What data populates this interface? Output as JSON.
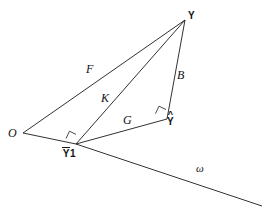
{
  "figure": {
    "type": "geometry-diagram",
    "stroke_color": "#1a1a1a",
    "background_color": "#ffffff",
    "vertices": [
      {
        "id": "O",
        "label": "O",
        "style": "italic-serif",
        "x": 23,
        "y": 133
      },
      {
        "id": "Ybar1",
        "label": "Y",
        "accent": "bar",
        "subscript": "1",
        "style": "bold-sans",
        "x": 76,
        "y": 144
      },
      {
        "id": "Yhat",
        "label": "Y",
        "accent": "hat",
        "style": "bold-sans",
        "x": 167,
        "y": 119
      },
      {
        "id": "Y",
        "label": "Y",
        "style": "bold-sans",
        "x": 185,
        "y": 20
      }
    ],
    "segments": [
      {
        "id": "F",
        "label": "F",
        "from": "O",
        "to": "Y",
        "label_x": 86,
        "label_y": 69
      },
      {
        "id": "K",
        "label": "K",
        "from": "Ybar1",
        "to": "Y",
        "label_x": 101,
        "label_y": 98
      },
      {
        "id": "G",
        "label": "G",
        "from": "Ybar1",
        "to": "Yhat",
        "label_x": 123,
        "label_y": 120
      },
      {
        "id": "B",
        "label": "B",
        "from": "Yhat",
        "to": "Y",
        "label_x": 177,
        "label_y": 75
      },
      {
        "id": "base",
        "label": "",
        "from": "O",
        "to": "Ybar1",
        "label_x": 0,
        "label_y": 0
      }
    ],
    "axis_line": {
      "id": "omega",
      "label": "ω",
      "from_x": 23,
      "from_y": 133,
      "to_x": 262,
      "to_y": 206,
      "label_x": 196,
      "label_y": 168
    },
    "right_angles": [
      {
        "id": "right-angle-at-Ybar1",
        "at": "Ybar1",
        "x": 68,
        "y": 133
      },
      {
        "id": "right-angle-at-Yhat",
        "at": "Yhat",
        "x": 157,
        "y": 111
      }
    ]
  }
}
